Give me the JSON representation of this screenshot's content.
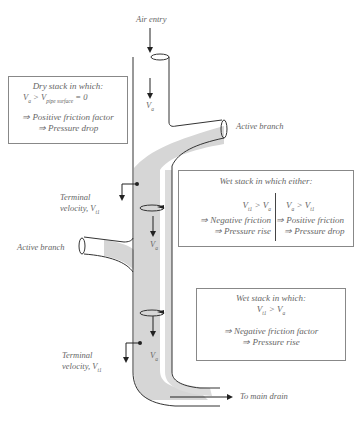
{
  "labels": {
    "air_entry": "Air entry",
    "active_branch_top": "Active branch",
    "active_branch_left": "Active branch",
    "terminal_velocity_1": "Terminal",
    "terminal_velocity_1b": "velocity, V",
    "terminal_velocity_1_sub": "t1",
    "terminal_velocity_2": "Terminal",
    "terminal_velocity_2b": "velocity, V",
    "terminal_velocity_2_sub": "t1",
    "to_main_drain": "To main drain",
    "va_1": "V",
    "va_1_sub": "a",
    "va_2": "V",
    "va_2_sub": "a",
    "va_3": "V",
    "va_3_sub": "a"
  },
  "box_dry": {
    "title": "Dry stack in which:",
    "cond_v": "V",
    "cond_sub_a": "a",
    "cond_gt": " > V",
    "cond_sub_pipe": "pipe surface",
    "cond_eq": " = 0",
    "line1": "⇒ Positive friction factor",
    "line2": "⇒ Pressure drop"
  },
  "box_wet_either": {
    "title": "Wet stack in which either:",
    "left": {
      "cond_v": "V",
      "cond_sub1": "t1",
      "cond_gt": " > V",
      "cond_sub2": "a",
      "line1": "⇒ Negative friction",
      "line2": "⇒ Pressure rise"
    },
    "right": {
      "cond_v": "V",
      "cond_sub1": "a",
      "cond_gt": " > V",
      "cond_sub2": "t1",
      "line1": "⇒ Positive friction",
      "line2": "⇒ Pressure drop"
    }
  },
  "box_wet": {
    "title": "Wet stack in which:",
    "cond_v": "V",
    "cond_sub1": "t1",
    "cond_gt": " > V",
    "cond_sub2": "a",
    "line1": "⇒ Negative friction factor",
    "line2": "⇒ Pressure rise"
  },
  "colors": {
    "pipe_outline": "#333333",
    "water_film": "#d4d4d4",
    "box_border": "#888888",
    "text": "#666666"
  }
}
